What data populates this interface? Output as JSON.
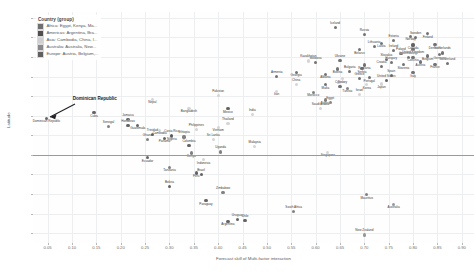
{
  "legend": {
    "title": "Country (group)",
    "items": [
      {
        "label": "Africa: Egypt, Kenya, Ma...",
        "color": "#6f6f6f"
      },
      {
        "label": "Americas: Argentina, Bra...",
        "color": "#4f4f4f"
      },
      {
        "label": "Asia: Cambodia, China, I...",
        "color": "#cfcfcf"
      },
      {
        "label": "Australia: Australia, New...",
        "color": "#8a8a8a"
      },
      {
        "label": "Europe: Austria, Belgium,...",
        "color": "#606060"
      }
    ]
  },
  "annotation": {
    "text": "Dominican Republic"
  },
  "chart_data": {
    "type": "scatter",
    "title": "",
    "xlabel": "Forecast skill of Multi-factor interaction",
    "ylabel": "Latitude",
    "xlim": [
      0.02,
      0.925
    ],
    "ylim": [
      -45,
      73
    ],
    "xticks": [
      "0.05",
      "0.10",
      "0.15",
      "0.20",
      "0.25",
      "0.30",
      "0.35",
      "0.40",
      "0.45",
      "0.50",
      "0.55",
      "0.60",
      "0.65",
      "0.70",
      "0.75",
      "0.80",
      "0.85",
      "0.90"
    ],
    "xtick_values": [
      0.05,
      0.1,
      0.15,
      0.2,
      0.25,
      0.3,
      0.35,
      0.4,
      0.45,
      0.5,
      0.55,
      0.6,
      0.65,
      0.7,
      0.75,
      0.8,
      0.85,
      0.9
    ],
    "yticks": [
      "70",
      "60",
      "50",
      "40",
      "30",
      "20",
      "10",
      "0",
      "-10",
      "-20",
      "-30",
      "-40"
    ],
    "ytick_values": [
      70,
      60,
      50,
      40,
      30,
      20,
      10,
      0,
      -10,
      -20,
      -30,
      -40
    ],
    "grid": true,
    "reference_line_y": 0,
    "legend_position": "top-left",
    "series": [
      {
        "name": "Africa: Egypt, Kenya, Ma...",
        "color": "#6f6f6f",
        "points": [
          {
            "label": "Senegal",
            "x": 0.175,
            "y": 14.5
          },
          {
            "label": "Kenya",
            "x": 0.345,
            "y": 1.0
          },
          {
            "label": "Uganda",
            "x": 0.405,
            "y": 1.5
          },
          {
            "label": "Morocco",
            "x": 0.595,
            "y": 32.0
          },
          {
            "label": "Egypt",
            "x": 0.63,
            "y": 26.8
          },
          {
            "label": "Tunisia",
            "x": 0.665,
            "y": 34.0
          },
          {
            "label": "South Africa",
            "x": 0.555,
            "y": -29.0
          },
          {
            "label": "Nigeria",
            "x": 0.305,
            "y": 9.5
          },
          {
            "label": "Ghana",
            "x": 0.255,
            "y": 7.9
          },
          {
            "label": "Algeria",
            "x": 0.62,
            "y": 28.0
          },
          {
            "label": "Ethiopia",
            "x": 0.33,
            "y": 9.1
          },
          {
            "label": "Tanzania",
            "x": 0.3,
            "y": -6.3
          },
          {
            "label": "Zimbabwe",
            "x": 0.41,
            "y": -19.0
          },
          {
            "label": "Mauritius",
            "x": 0.705,
            "y": -20.3
          }
        ]
      },
      {
        "name": "Americas: Argentina, Bra...",
        "color": "#4f4f4f",
        "points": [
          {
            "label": "Dominican Republic",
            "x": 0.048,
            "y": 18.7
          },
          {
            "label": "Brazil",
            "x": 0.365,
            "y": -10.0
          },
          {
            "label": "Argentina",
            "x": 0.42,
            "y": -34.0
          },
          {
            "label": "Chile",
            "x": 0.455,
            "y": -33.5
          },
          {
            "label": "Peru",
            "x": 0.355,
            "y": -9.2
          },
          {
            "label": "Colombia",
            "x": 0.34,
            "y": 4.6
          },
          {
            "label": "Mexico",
            "x": 0.42,
            "y": 23.6
          },
          {
            "label": "Costa Rica",
            "x": 0.305,
            "y": 9.9
          },
          {
            "label": "Panama",
            "x": 0.29,
            "y": 8.5
          },
          {
            "label": "Uruguay",
            "x": 0.44,
            "y": -33.0
          },
          {
            "label": "Canada",
            "x": 0.8,
            "y": 56.1
          },
          {
            "label": "United States",
            "x": 0.745,
            "y": 38.0
          },
          {
            "label": "Ecuador",
            "x": 0.255,
            "y": -1.5
          },
          {
            "label": "Bolivia",
            "x": 0.3,
            "y": -16.3
          },
          {
            "label": "Paraguay",
            "x": 0.375,
            "y": -23.4
          },
          {
            "label": "Jamaica",
            "x": 0.215,
            "y": 18.1
          },
          {
            "label": "Guatemala",
            "x": 0.235,
            "y": 15.0
          },
          {
            "label": "Honduras",
            "x": 0.215,
            "y": 14.9
          },
          {
            "label": "Cuba",
            "x": 0.145,
            "y": 21.5
          },
          {
            "label": "Trinidad",
            "x": 0.265,
            "y": 10.6
          }
        ]
      },
      {
        "name": "Asia: Cambodia, China, I...",
        "color": "#cfcfcf",
        "points": [
          {
            "label": "China",
            "x": 0.56,
            "y": 35.8
          },
          {
            "label": "Japan",
            "x": 0.735,
            "y": 36.2
          },
          {
            "label": "India",
            "x": 0.47,
            "y": 20.6
          },
          {
            "label": "Indonesia",
            "x": 0.37,
            "y": -2.5
          },
          {
            "label": "Thailand",
            "x": 0.42,
            "y": 15.9
          },
          {
            "label": "Vietnam",
            "x": 0.4,
            "y": 14.1
          },
          {
            "label": "Malaysia",
            "x": 0.475,
            "y": 4.2
          },
          {
            "label": "Singapore",
            "x": 0.625,
            "y": 1.4
          },
          {
            "label": "Philippines",
            "x": 0.355,
            "y": 12.9
          },
          {
            "label": "Korea",
            "x": 0.705,
            "y": 35.9
          },
          {
            "label": "Israel",
            "x": 0.69,
            "y": 31.0
          },
          {
            "label": "Turkey",
            "x": 0.655,
            "y": 38.9
          },
          {
            "label": "Saudi Arabia",
            "x": 0.61,
            "y": 23.9
          },
          {
            "label": "Cambodia",
            "x": 0.28,
            "y": 12.6
          },
          {
            "label": "Pakistan",
            "x": 0.4,
            "y": 30.4
          },
          {
            "label": "Bangladesh",
            "x": 0.34,
            "y": 23.7
          },
          {
            "label": "Sri Lanka",
            "x": 0.39,
            "y": 7.9
          },
          {
            "label": "Nepal",
            "x": 0.265,
            "y": 28.4
          },
          {
            "label": "Kazakhstan",
            "x": 0.585,
            "y": 48.0
          },
          {
            "label": "Iran",
            "x": 0.52,
            "y": 32.4
          }
        ]
      },
      {
        "name": "Australia: Australia, New...",
        "color": "#8a8a8a",
        "points": [
          {
            "label": "Australia",
            "x": 0.76,
            "y": -25.3
          },
          {
            "label": "New Zealand",
            "x": 0.7,
            "y": -40.9
          }
        ]
      },
      {
        "name": "Europe: Austria, Belgium,...",
        "color": "#606060",
        "points": [
          {
            "label": "Iceland",
            "x": 0.64,
            "y": 64.9
          },
          {
            "label": "Norway",
            "x": 0.795,
            "y": 60.5
          },
          {
            "label": "Sweden",
            "x": 0.805,
            "y": 60.1
          },
          {
            "label": "Finland",
            "x": 0.83,
            "y": 61.9
          },
          {
            "label": "Estonia",
            "x": 0.76,
            "y": 58.6
          },
          {
            "label": "Latvia",
            "x": 0.735,
            "y": 56.9
          },
          {
            "label": "Lithuania",
            "x": 0.72,
            "y": 55.2
          },
          {
            "label": "Denmark",
            "x": 0.845,
            "y": 56.3
          },
          {
            "label": "Ireland",
            "x": 0.76,
            "y": 53.4
          },
          {
            "label": "United Kingdom",
            "x": 0.8,
            "y": 54.0
          },
          {
            "label": "Netherlands",
            "x": 0.86,
            "y": 52.1
          },
          {
            "label": "Germany",
            "x": 0.855,
            "y": 51.2
          },
          {
            "label": "Poland",
            "x": 0.775,
            "y": 51.9
          },
          {
            "label": "Belarus",
            "x": 0.69,
            "y": 53.7
          },
          {
            "label": "Russia",
            "x": 0.7,
            "y": 61.5
          },
          {
            "label": "Belgium",
            "x": 0.83,
            "y": 50.5
          },
          {
            "label": "Luxembourg",
            "x": 0.79,
            "y": 49.8
          },
          {
            "label": "Czechia",
            "x": 0.8,
            "y": 49.8
          },
          {
            "label": "Slovakia",
            "x": 0.745,
            "y": 48.7
          },
          {
            "label": "Austria",
            "x": 0.815,
            "y": 47.5
          },
          {
            "label": "Switzerland",
            "x": 0.87,
            "y": 46.8
          },
          {
            "label": "France",
            "x": 0.845,
            "y": 46.2
          },
          {
            "label": "Hungary",
            "x": 0.755,
            "y": 47.2
          },
          {
            "label": "Romania",
            "x": 0.7,
            "y": 45.9
          },
          {
            "label": "Ukraine",
            "x": 0.65,
            "y": 48.4
          },
          {
            "label": "Slovenia",
            "x": 0.78,
            "y": 46.1
          },
          {
            "label": "Croatia",
            "x": 0.735,
            "y": 45.1
          },
          {
            "label": "Serbia",
            "x": 0.695,
            "y": 44.0
          },
          {
            "label": "Bulgaria",
            "x": 0.67,
            "y": 42.7
          },
          {
            "label": "Italy",
            "x": 0.8,
            "y": 41.9
          },
          {
            "label": "Spain",
            "x": 0.755,
            "y": 40.5
          },
          {
            "label": "Portugal",
            "x": 0.71,
            "y": 39.4
          },
          {
            "label": "Greece",
            "x": 0.69,
            "y": 39.1
          },
          {
            "label": "Albania",
            "x": 0.62,
            "y": 41.2
          },
          {
            "label": "Cyprus",
            "x": 0.65,
            "y": 35.1
          },
          {
            "label": "Malta",
            "x": 0.62,
            "y": 35.9
          },
          {
            "label": "Moldova",
            "x": 0.6,
            "y": 47.0
          },
          {
            "label": "Georgia",
            "x": 0.56,
            "y": 42.3
          },
          {
            "label": "Armenia",
            "x": 0.52,
            "y": 40.1
          },
          {
            "label": "Bosnia",
            "x": 0.645,
            "y": 43.9
          }
        ]
      }
    ]
  }
}
